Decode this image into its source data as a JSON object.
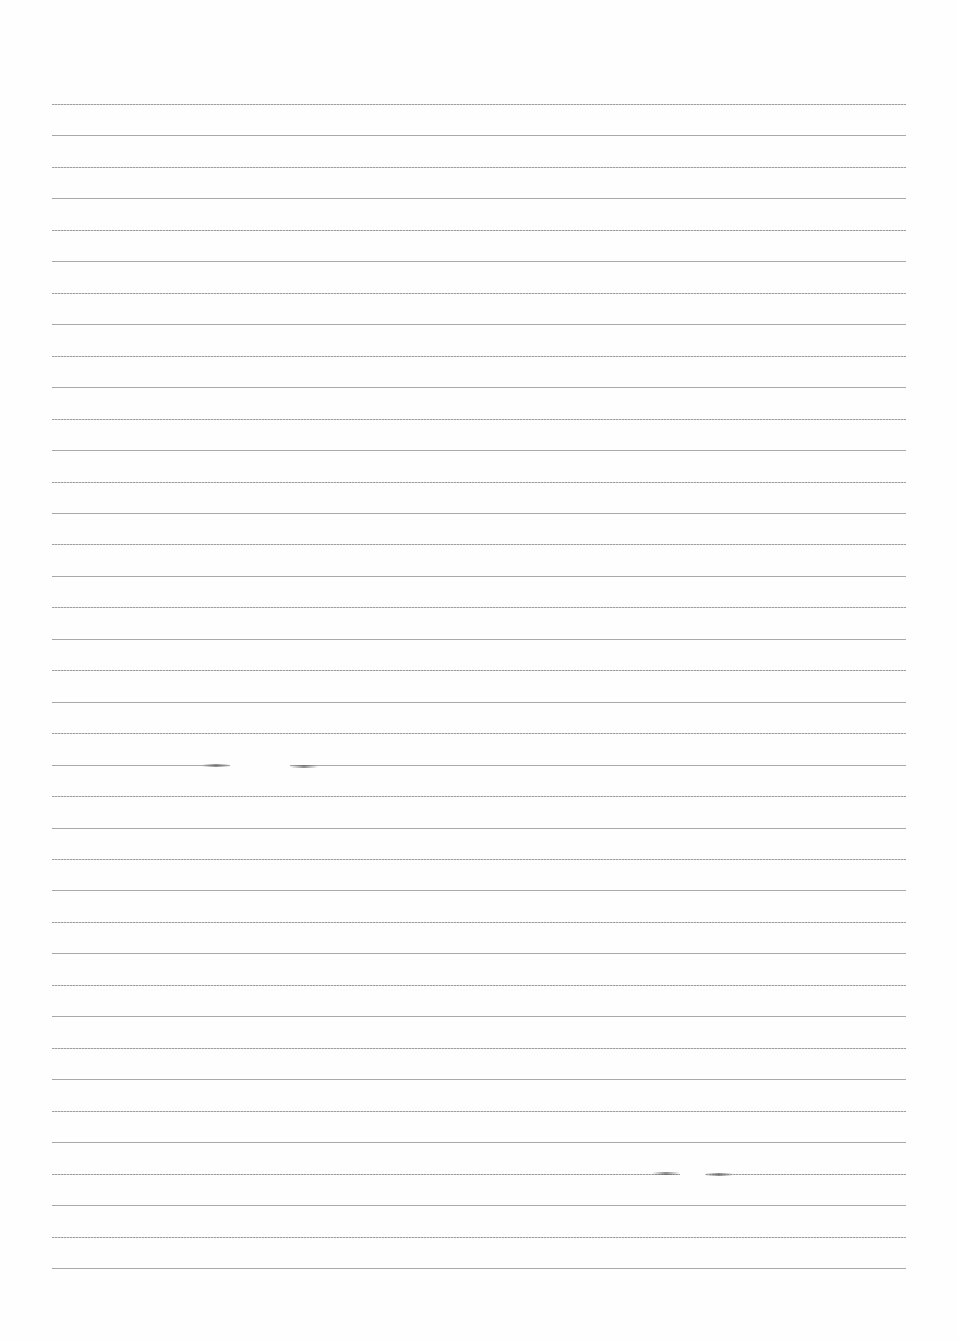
{
  "page": {
    "type": "ruled-paper",
    "width": 959,
    "height": 1340,
    "background_color": "#fefefe",
    "line_color": "#9a9a9a",
    "line_count": 38,
    "first_line_y": 104,
    "last_line_y": 1268,
    "line_left_x": 52,
    "line_right_x": 906,
    "text_content": ""
  },
  "artifacts": [
    {
      "kind": "line-gap",
      "y": 765,
      "x_start": 230,
      "x_end": 290
    },
    {
      "kind": "line-gap",
      "y": 1173,
      "x_start": 680,
      "x_end": 705
    }
  ]
}
